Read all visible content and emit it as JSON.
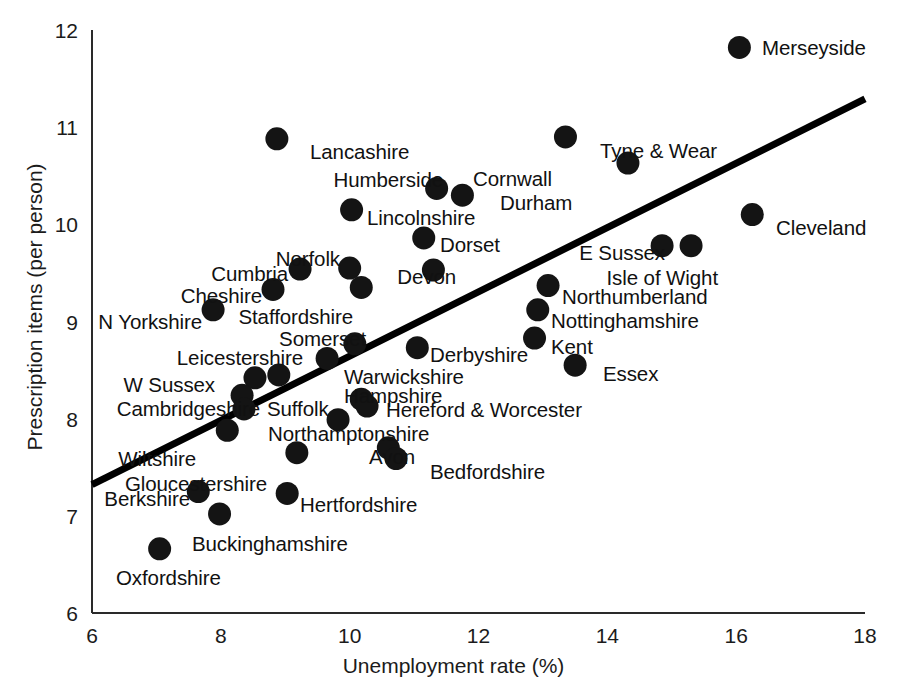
{
  "chart_data": {
    "type": "scatter",
    "title": "",
    "xlabel": "Unemployment rate (%)",
    "ylabel": "Prescription items (per person)",
    "xlim": [
      6,
      18
    ],
    "ylim": [
      6,
      12
    ],
    "xticks": [
      "6",
      "8",
      "10",
      "12",
      "14",
      "16",
      "18"
    ],
    "yticks": [
      "6",
      "7",
      "8",
      "9",
      "10",
      "11",
      "12"
    ],
    "grid": false,
    "legend": "none",
    "series": [
      {
        "name": "English counties",
        "points": [
          {
            "label": "Merseyside",
            "x": 16.05,
            "y": 11.82,
            "lx": 762,
            "ly": 38,
            "align": "left"
          },
          {
            "label": "Lancashire",
            "x": 8.87,
            "y": 10.88,
            "lx": 310,
            "ly": 142,
            "align": "left"
          },
          {
            "label": "Tyne & Wear",
            "x": 13.35,
            "y": 10.9,
            "lx": 600,
            "ly": 141,
            "align": "left"
          },
          {
            "label": "Cornwall",
            "x": 14.32,
            "y": 10.63,
            "lx": 552,
            "ly": 169,
            "align": "right"
          },
          {
            "label": "Humberside",
            "x": 11.35,
            "y": 10.37,
            "lx": 443,
            "ly": 170,
            "align": "right"
          },
          {
            "label": "Durham",
            "x": 11.75,
            "y": 10.3,
            "lx": 500,
            "ly": 193,
            "align": "left"
          },
          {
            "label": "Lincolnshire",
            "x": 10.03,
            "y": 10.15,
            "lx": 367,
            "ly": 208,
            "align": "left"
          },
          {
            "label": "Cleveland",
            "x": 16.25,
            "y": 10.1,
            "lx": 776,
            "ly": 218,
            "align": "left"
          },
          {
            "label": "Dorset",
            "x": 11.15,
            "y": 9.86,
            "lx": 440,
            "ly": 235,
            "align": "left"
          },
          {
            "label": "E Sussex",
            "x": 14.85,
            "y": 9.78,
            "lx": 665,
            "ly": 243,
            "align": "right"
          },
          {
            "label": "Isle of Wight",
            "x": 15.3,
            "y": 9.78,
            "lx": 718,
            "ly": 268,
            "align": "right"
          },
          {
            "label": "Norfolk",
            "x": 10.0,
            "y": 9.55,
            "lx": 340,
            "ly": 249,
            "align": "right"
          },
          {
            "label": "Cumbria",
            "x": 9.23,
            "y": 9.54,
            "lx": 288,
            "ly": 264,
            "align": "right"
          },
          {
            "label": "Devon",
            "x": 11.3,
            "y": 9.53,
            "lx": 456,
            "ly": 267,
            "align": "right"
          },
          {
            "label": "Staffordshire",
            "x": 10.18,
            "y": 9.35,
            "lx": 353,
            "ly": 307,
            "align": "right"
          },
          {
            "label": "Cheshire",
            "x": 8.81,
            "y": 9.33,
            "lx": 262,
            "ly": 286,
            "align": "right"
          },
          {
            "label": "Northumberland",
            "x": 13.08,
            "y": 9.37,
            "lx": 562,
            "ly": 287,
            "align": "left"
          },
          {
            "label": "Nottinghamshire",
            "x": 12.92,
            "y": 9.12,
            "lx": 551,
            "ly": 311,
            "align": "left"
          },
          {
            "label": "N Yorkshire",
            "x": 7.88,
            "y": 9.12,
            "lx": 202,
            "ly": 312,
            "align": "right"
          },
          {
            "label": "Kent",
            "x": 12.87,
            "y": 8.83,
            "lx": 551,
            "ly": 337,
            "align": "left"
          },
          {
            "label": "Somerset",
            "x": 10.08,
            "y": 8.77,
            "lx": 366,
            "ly": 329,
            "align": "right"
          },
          {
            "label": "Derbyshire",
            "x": 11.05,
            "y": 8.73,
            "lx": 430,
            "ly": 345,
            "align": "left"
          },
          {
            "label": "Leicestershire",
            "x": 9.65,
            "y": 8.62,
            "lx": 303,
            "ly": 348,
            "align": "right"
          },
          {
            "label": "Essex",
            "x": 13.5,
            "y": 8.55,
            "lx": 603,
            "ly": 364,
            "align": "left"
          },
          {
            "label": "Warwickshire",
            "x": 8.9,
            "y": 8.45,
            "lx": 344,
            "ly": 367,
            "align": "left"
          },
          {
            "label": "W Sussex",
            "x": 8.53,
            "y": 8.42,
            "lx": 215,
            "ly": 375,
            "align": "right"
          },
          {
            "label": "Hampshire",
            "x": 10.18,
            "y": 8.2,
            "lx": 344,
            "ly": 386,
            "align": "left"
          },
          {
            "label": "Cambridgeshire",
            "x": 8.33,
            "y": 8.24,
            "lx": 260,
            "ly": 399,
            "align": "right"
          },
          {
            "label": "Suffolk",
            "x": 8.36,
            "y": 8.1,
            "lx": 267,
            "ly": 399,
            "align": "left"
          },
          {
            "label": "Hereford & Worcester",
            "x": 10.27,
            "y": 8.13,
            "lx": 386,
            "ly": 400,
            "align": "left"
          },
          {
            "label": "Northamptonshire",
            "x": 9.82,
            "y": 7.99,
            "lx": 268,
            "ly": 424,
            "align": "left"
          },
          {
            "label": "Wiltshire",
            "x": 8.1,
            "y": 7.88,
            "lx": 196,
            "ly": 449,
            "align": "right"
          },
          {
            "label": "Avon",
            "x": 10.6,
            "y": 7.7,
            "lx": 415,
            "ly": 447,
            "align": "right"
          },
          {
            "label": "Bedfordshire",
            "x": 10.72,
            "y": 7.59,
            "lx": 430,
            "ly": 462,
            "align": "left"
          },
          {
            "label": "Gloucestershire",
            "x": 9.18,
            "y": 7.65,
            "lx": 267,
            "ly": 474,
            "align": "right"
          },
          {
            "label": "Berkshire",
            "x": 7.65,
            "y": 7.25,
            "lx": 190,
            "ly": 489,
            "align": "right"
          },
          {
            "label": "Hertfordshire",
            "x": 9.03,
            "y": 7.23,
            "lx": 300,
            "ly": 495,
            "align": "left"
          },
          {
            "label": "Buckinghamshire",
            "x": 7.98,
            "y": 7.02,
            "lx": 192,
            "ly": 534,
            "align": "left"
          },
          {
            "label": "Oxfordshire",
            "x": 7.05,
            "y": 6.66,
            "lx": 116,
            "ly": 568,
            "align": "left"
          }
        ]
      }
    ],
    "trend_line": {
      "name": "regression-line",
      "x_start": 6,
      "y_start": 7.32,
      "x_end": 18,
      "y_end": 11.29
    }
  },
  "colors": {
    "point": "#141414",
    "line": "#000000",
    "axis": "#2a2a2a",
    "background": "#ffffff"
  }
}
